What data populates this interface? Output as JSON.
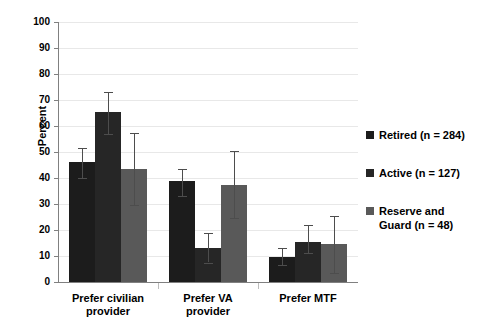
{
  "chart_data": {
    "type": "bar",
    "title": "",
    "subtitle": "",
    "xlabel": "",
    "ylabel": "Percent",
    "ylim": [
      0,
      100
    ],
    "ytick_step": 10,
    "yticks": [
      "100",
      "90",
      "80",
      "70",
      "60",
      "50",
      "40",
      "30",
      "20",
      "10",
      "0"
    ],
    "grid": true,
    "legend_position": "right",
    "categories": [
      "Prefer civilian provider",
      "Prefer VA provider",
      "Prefer MTF"
    ],
    "series": [
      {
        "name": "Retired (n = 284)",
        "color": "#1c1c1c",
        "values": [
          46,
          39,
          9.5
        ],
        "err_low": [
          40,
          33,
          6.5
        ],
        "err_high": [
          51.5,
          43.5,
          13
        ]
      },
      {
        "name": "Active (n = 127)",
        "color": "#262626",
        "values": [
          65.3,
          13,
          15.5
        ],
        "err_low": [
          57,
          7.5,
          11
        ],
        "err_high": [
          73,
          19,
          22
        ]
      },
      {
        "name": "Reserve and Guard (n = 48)",
        "color": "#595959",
        "values": [
          43.5,
          37.5,
          14.5
        ],
        "err_low": [
          29.5,
          24.5,
          3.5
        ],
        "err_high": [
          57.5,
          50.5,
          25.5
        ]
      }
    ]
  },
  "axis": {
    "y_title": "Percent"
  },
  "categories_display": [
    "Prefer civilian\nprovider",
    "Prefer VA\nprovider",
    "Prefer MTF"
  ],
  "legend": {
    "items": [
      {
        "label": "Retired (n = 284)",
        "color": "#1c1c1c"
      },
      {
        "label": "Active (n = 127)",
        "color": "#262626"
      },
      {
        "label": "Reserve and\nGuard (n = 48)",
        "color": "#595959"
      }
    ]
  }
}
